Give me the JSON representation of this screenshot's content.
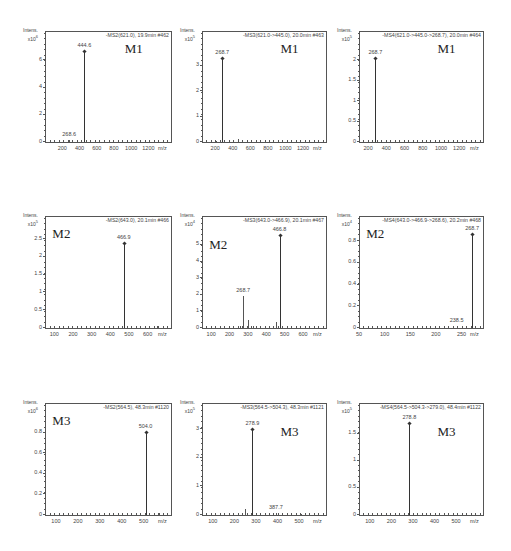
{
  "chart_data": [
    {
      "type": "bar",
      "panel": "row1-col1",
      "compound": "M1",
      "scan": "-MS2(621.0), 19.9min #462",
      "ylabel": "Intens.",
      "yscale": "x10^6",
      "xlabel": "m/z",
      "xlim": [
        0,
        1450
      ],
      "ylim": [
        0,
        7.5
      ],
      "xticks": [
        200,
        400,
        600,
        800,
        1000,
        1200
      ],
      "yticks": [
        0,
        2,
        4,
        6
      ],
      "peaks": [
        {
          "mz": 268.6,
          "intensity": 0.12,
          "label": "268.6"
        },
        {
          "mz": 444.6,
          "intensity": 6.7,
          "label": "444.6"
        },
        {
          "mz": 620.0,
          "intensity": 0.15,
          "label": ""
        }
      ]
    },
    {
      "type": "bar",
      "panel": "row1-col2",
      "compound": "M1",
      "scan": "-MS3(621.0->445.0), 20.0min #463",
      "ylabel": "Intens.",
      "yscale": "x10^5",
      "xlabel": "m/z",
      "xlim": [
        50,
        1450
      ],
      "ylim": [
        0,
        4
      ],
      "xticks": [
        200,
        400,
        600,
        800,
        1000,
        1200
      ],
      "yticks": [
        0,
        1,
        2,
        3
      ],
      "peaks": [
        {
          "mz": 200.0,
          "intensity": 0.05,
          "label": ""
        },
        {
          "mz": 268.7,
          "intensity": 3.3,
          "label": "268.7"
        },
        {
          "mz": 445.0,
          "intensity": 0.1,
          "label": ""
        }
      ]
    },
    {
      "type": "bar",
      "panel": "row1-col3",
      "compound": "M1",
      "scan": "-MS4(621.0->445.0->268.7), 20.0min #464",
      "ylabel": "Intens.",
      "yscale": "x10^5",
      "xlabel": "m/z",
      "xlim": [
        100,
        1450
      ],
      "ylim": [
        0,
        2.5
      ],
      "xticks": [
        200,
        400,
        600,
        800,
        1000,
        1200
      ],
      "yticks": [
        0.0,
        0.5,
        1.0,
        1.5,
        2.0
      ],
      "peaks": [
        {
          "mz": 268.7,
          "intensity": 2.05,
          "label": "268.7"
        }
      ]
    },
    {
      "type": "bar",
      "panel": "row2-col1",
      "compound": "M2",
      "scan": "-MS2(643.0), 20.1min #466",
      "ylabel": "Intens.",
      "yscale": "x10^5",
      "xlabel": "m/z",
      "xlim": [
        50,
        720
      ],
      "ylim": [
        0,
        2.9
      ],
      "xticks": [
        100,
        200,
        300,
        400,
        500,
        600
      ],
      "yticks": [
        0.0,
        0.5,
        1.0,
        1.5,
        2.0,
        2.5
      ],
      "peaks": [
        {
          "mz": 466.9,
          "intensity": 2.4,
          "label": "466.9"
        },
        {
          "mz": 643.0,
          "intensity": 0.06,
          "label": ""
        }
      ]
    },
    {
      "type": "bar",
      "panel": "row2-col2",
      "compound": "M2",
      "scan": "-MS3(643.0->466.9), 20.1min #467",
      "ylabel": "Intens.",
      "yscale": "x10^4",
      "xlabel": "m/z",
      "xlim": [
        50,
        720
      ],
      "ylim": [
        0,
        6.2
      ],
      "xticks": [
        100,
        200,
        300,
        400,
        500,
        600
      ],
      "yticks": [
        0,
        1,
        2,
        3,
        4,
        5
      ],
      "peaks": [
        {
          "mz": 268.7,
          "intensity": 1.9,
          "label": "268.7"
        },
        {
          "mz": 295.0,
          "intensity": 0.5,
          "label": ""
        },
        {
          "mz": 250.0,
          "intensity": 0.15,
          "label": ""
        },
        {
          "mz": 320.0,
          "intensity": 0.15,
          "label": ""
        },
        {
          "mz": 448.0,
          "intensity": 0.35,
          "label": ""
        },
        {
          "mz": 466.8,
          "intensity": 5.6,
          "label": "466.8"
        }
      ]
    },
    {
      "type": "bar",
      "panel": "row2-col3",
      "compound": "M2",
      "scan": "-MS4(643.0->466.9->268.6), 20.2min #468",
      "ylabel": "Intens.",
      "yscale": "x10^4",
      "xlabel": "m/z",
      "xlim": [
        50,
        290
      ],
      "ylim": [
        0,
        0.95
      ],
      "xticks": [
        50,
        100,
        150,
        200,
        250
      ],
      "yticks": [
        0.0,
        0.2,
        0.4,
        0.6,
        0.8
      ],
      "peaks": [
        {
          "mz": 238.5,
          "intensity": 0.02,
          "label": "238.5"
        },
        {
          "mz": 268.7,
          "intensity": 0.87,
          "label": "268.7"
        }
      ]
    },
    {
      "type": "bar",
      "panel": "row3-col1",
      "compound": "M3",
      "scan": "-MS2(564.5), 48.3min #1120",
      "ylabel": "Intens.",
      "yscale": "x10^6",
      "xlabel": "m/z",
      "xlim": [
        50,
        620
      ],
      "ylim": [
        0,
        1.0
      ],
      "xticks": [
        100,
        200,
        300,
        400,
        500
      ],
      "yticks": [
        0.0,
        0.2,
        0.4,
        0.6,
        0.8
      ],
      "peaks": [
        {
          "mz": 504.0,
          "intensity": 0.81,
          "label": "504.0"
        },
        {
          "mz": 564.0,
          "intensity": 0.02,
          "label": ""
        }
      ]
    },
    {
      "type": "bar",
      "panel": "row3-col2",
      "compound": "M3",
      "scan": "-MS3(564.5->504.3), 48.3min #1121",
      "ylabel": "Intens.",
      "yscale": "x10^5",
      "xlabel": "m/z",
      "xlim": [
        50,
        620
      ],
      "ylim": [
        0,
        3.6
      ],
      "xticks": [
        100,
        200,
        300,
        400,
        500
      ],
      "yticks": [
        0,
        1,
        2,
        3
      ],
      "peaks": [
        {
          "mz": 245.0,
          "intensity": 0.2,
          "label": ""
        },
        {
          "mz": 275.0,
          "intensity": 0.55,
          "label": ""
        },
        {
          "mz": 278.9,
          "intensity": 3.0,
          "label": "278.9"
        },
        {
          "mz": 387.7,
          "intensity": 0.07,
          "label": "387.7"
        },
        {
          "mz": 504.0,
          "intensity": 0.03,
          "label": ""
        }
      ]
    },
    {
      "type": "bar",
      "panel": "row3-col3",
      "compound": "M3",
      "scan": "-MS4(564.5->504.3->279.0), 48.4min #1122",
      "ylabel": "Intens.",
      "yscale": "x10^5",
      "xlabel": "m/z",
      "xlim": [
        50,
        620
      ],
      "ylim": [
        0,
        1.9
      ],
      "xticks": [
        100,
        200,
        300,
        400,
        500
      ],
      "yticks": [
        0.0,
        0.5,
        1.0,
        1.5
      ],
      "peaks": [
        {
          "mz": 275.0,
          "intensity": 0.25,
          "label": ""
        },
        {
          "mz": 278.8,
          "intensity": 1.7,
          "label": "278.8"
        }
      ]
    }
  ],
  "panels": [
    {
      "compound": "M1",
      "scan": "-MS2(621.0), 19.9min #462",
      "ylabel": "Intens.",
      "yscale_base": "x10",
      "yscale_exp": "6",
      "xunit": "m/z"
    },
    {
      "compound": "M1",
      "scan": "-MS3(621.0->445.0), 20.0min #463",
      "ylabel": "Intens.",
      "yscale_base": "x10",
      "yscale_exp": "5",
      "xunit": "m/z"
    },
    {
      "compound": "M1",
      "scan": "-MS4(621.0->445.0->268.7), 20.0min #464",
      "ylabel": "Intens.",
      "yscale_base": "x10",
      "yscale_exp": "5",
      "xunit": "m/z"
    },
    {
      "compound": "M2",
      "scan": "-MS2(643.0), 20.1min #466",
      "ylabel": "Intens.",
      "yscale_base": "x10",
      "yscale_exp": "5",
      "xunit": "m/z"
    },
    {
      "compound": "M2",
      "scan": "-MS3(643.0->466.9), 20.1min #467",
      "ylabel": "Intens.",
      "yscale_base": "x10",
      "yscale_exp": "4",
      "xunit": "m/z"
    },
    {
      "compound": "M2",
      "scan": "-MS4(643.0->466.9->268.6), 20.2min #468",
      "ylabel": "Intens.",
      "yscale_base": "x10",
      "yscale_exp": "4",
      "xunit": "m/z"
    },
    {
      "compound": "M3",
      "scan": "-MS2(564.5), 48.3min #1120",
      "ylabel": "Intens.",
      "yscale_base": "x10",
      "yscale_exp": "6",
      "xunit": "m/z"
    },
    {
      "compound": "M3",
      "scan": "-MS3(564.5->504.3), 48.3min #1121",
      "ylabel": "Intens.",
      "yscale_base": "x10",
      "yscale_exp": "5",
      "xunit": "m/z"
    },
    {
      "compound": "M3",
      "scan": "-MS4(564.5->504.3->279.0), 48.4min #1122",
      "ylabel": "Intens.",
      "yscale_base": "x10",
      "yscale_exp": "5",
      "xunit": "m/z"
    }
  ]
}
